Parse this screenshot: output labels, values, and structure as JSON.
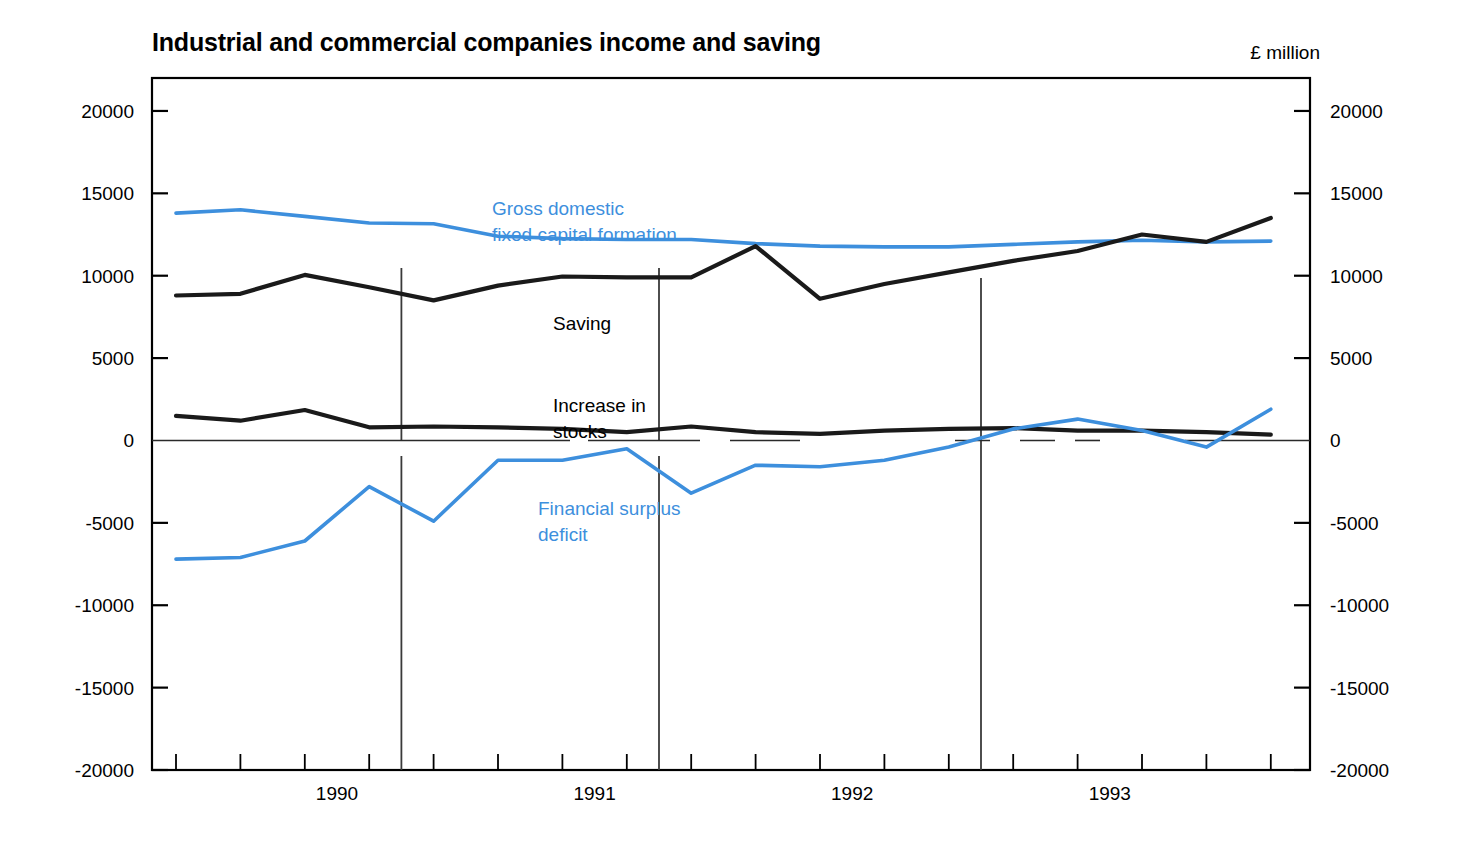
{
  "header": {
    "title": "Industrial and commercial companies income and saving",
    "units": "£ million"
  },
  "colors": {
    "blue": "#3d8fdd",
    "black": "#1a1a1a",
    "axis": "#000000",
    "background": "#ffffff"
  },
  "chart_data": {
    "type": "line",
    "title": "Industrial and commercial companies income and saving",
    "subtitle": "",
    "units": "£ million",
    "xlabel": "",
    "ylabel": "£ million",
    "ylim": [
      -20000,
      22000
    ],
    "ytick_values": [
      20000,
      15000,
      10000,
      5000,
      0,
      -5000,
      -10000,
      -15000,
      -20000
    ],
    "ytick_labels": [
      "20000",
      "15000",
      "10000",
      "5000",
      "0",
      "-5000",
      "-10000",
      "-15000",
      "-20000"
    ],
    "ytick_labels_right": [
      "20000",
      "15000",
      "10000",
      "5000",
      "0",
      "-5000",
      "-10000",
      "-15000",
      "-20000"
    ],
    "grid": false,
    "legend_position": "inline-annotations",
    "x": [
      "1989 Q4",
      "1990 Q1",
      "1990 Q2",
      "1990 Q3",
      "1990 Q4",
      "1991 Q1",
      "1991 Q2",
      "1991 Q3",
      "1991 Q4",
      "1992 Q1",
      "1992 Q2",
      "1992 Q3",
      "1992 Q4",
      "1993 Q1",
      "1993 Q2",
      "1993 Q3",
      "1993 Q4",
      "1994 Q1"
    ],
    "xtick_labels": [
      "1990",
      "1991",
      "1992",
      "1993"
    ],
    "xtick_label_positions": [
      "1990 Q2",
      "1991 Q2",
      "1992 Q2",
      "1993 Q2"
    ],
    "year_dividers": [
      "1990 Q4/1991 Q1",
      "1991 Q4/1992 Q1",
      "1992 Q4/1993 Q1"
    ],
    "series": [
      {
        "name": "Gross domestic fixed capital formation",
        "color": "#3d8fdd",
        "label_lines": [
          "Gross domestic",
          "fixed capital formation"
        ],
        "values": [
          13800,
          14000,
          13600,
          13200,
          13150,
          12400,
          12250,
          12200,
          12200,
          11950,
          11800,
          11750,
          11750,
          11900,
          12050,
          12150,
          12050,
          12100
        ]
      },
      {
        "name": "Saving",
        "color": "#1a1a1a",
        "label_lines": [
          "Saving"
        ],
        "values": [
          8800,
          8900,
          10050,
          9300,
          8500,
          9400,
          9950,
          9900,
          9900,
          11800,
          8600,
          9500,
          10200,
          10900,
          11500,
          12500,
          12050,
          13500
        ]
      },
      {
        "name": "Increase in stocks",
        "color": "#1a1a1a",
        "label_lines": [
          "Increase in",
          "stocks"
        ],
        "values": [
          1500,
          1200,
          1850,
          800,
          850,
          800,
          700,
          500,
          850,
          500,
          400,
          600,
          700,
          750,
          600,
          600,
          500,
          350
        ]
      },
      {
        "name": "Financial surplus deficit",
        "color": "#3d8fdd",
        "label_lines": [
          "Financial surplus",
          "deficit"
        ],
        "values": [
          -7200,
          -7100,
          -6100,
          -2800,
          -4900,
          -1200,
          -1200,
          -500,
          -3200,
          -1500,
          -1600,
          -1200,
          -400,
          700,
          1300,
          600,
          -400,
          1900
        ]
      }
    ]
  }
}
